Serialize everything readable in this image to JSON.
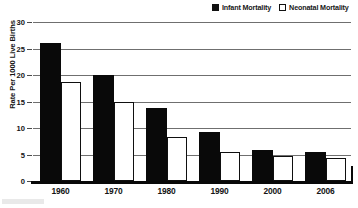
{
  "legend": {
    "position": "top-right",
    "entries": [
      {
        "label": "Infant Mortality",
        "swatch": "filled-square-icon",
        "color": "#090909"
      },
      {
        "label": "Neonatal Mortality",
        "swatch": "hollow-square-icon",
        "color": "#ffffff"
      }
    ]
  },
  "axes": {
    "ylabel": "Rate Per 1000 Live Births",
    "xlabel": "",
    "yticks": [
      0,
      5,
      10,
      15,
      20,
      25,
      30
    ],
    "ytick_labels": [
      "0",
      "5",
      "10",
      "15",
      "20",
      "25",
      "30"
    ]
  },
  "chart_data": {
    "type": "bar",
    "title": "",
    "subtitle": "",
    "xlabel": "",
    "ylabel": "Rate Per 1000 Live Births",
    "categories": [
      "1960",
      "1970",
      "1980",
      "1990",
      "2000",
      "2006"
    ],
    "series": [
      {
        "name": "Infant Mortality",
        "values": [
          26.0,
          20.0,
          13.8,
          9.3,
          5.9,
          5.4
        ],
        "color": "#090909"
      },
      {
        "name": "Neonatal Mortality",
        "values": [
          18.7,
          15.0,
          8.3,
          5.4,
          4.7,
          4.4
        ],
        "color": "#ffffff"
      }
    ],
    "ylim": [
      0,
      30
    ],
    "ytick_step": 5,
    "grid": true,
    "grid_axis": "y",
    "legend_position": "top-right"
  }
}
